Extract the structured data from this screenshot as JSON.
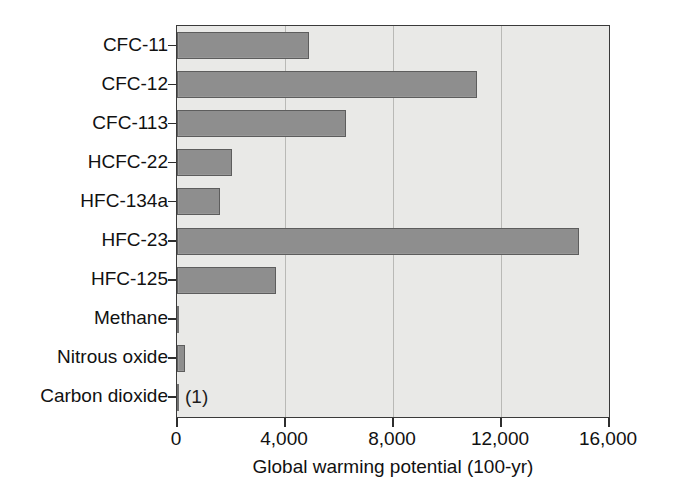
{
  "chart_data": {
    "type": "bar",
    "orientation": "horizontal",
    "title": "",
    "xlabel": "Global warming potential (100-yr)",
    "ylabel": "",
    "xlim": [
      0,
      16000
    ],
    "xticks": [
      0,
      4000,
      8000,
      12000,
      16000
    ],
    "xtick_labels": [
      "0",
      "4,000",
      "8,000",
      "12,000",
      "16,000"
    ],
    "grid": "vertical",
    "legend": "none",
    "categories": [
      "CFC-11",
      "CFC-12",
      "CFC-113",
      "HCFC-22",
      "HFC-134a",
      "HFC-23",
      "HFC-125",
      "Methane",
      "Nitrous oxide",
      "Carbon dioxide"
    ],
    "values": [
      4900,
      11100,
      6250,
      2050,
      1600,
      14900,
      3650,
      21,
      310,
      1
    ],
    "annotations": [
      {
        "category": "Carbon dioxide",
        "text": "(1)"
      }
    ],
    "colors": {
      "bar_fill": "#8e8e8e",
      "bar_edge": "#5d5d5d",
      "plot_background": "#e9e9e7",
      "gridline": "#b9b9b6",
      "axis": "#2e2e2e",
      "text": "#111111"
    }
  }
}
